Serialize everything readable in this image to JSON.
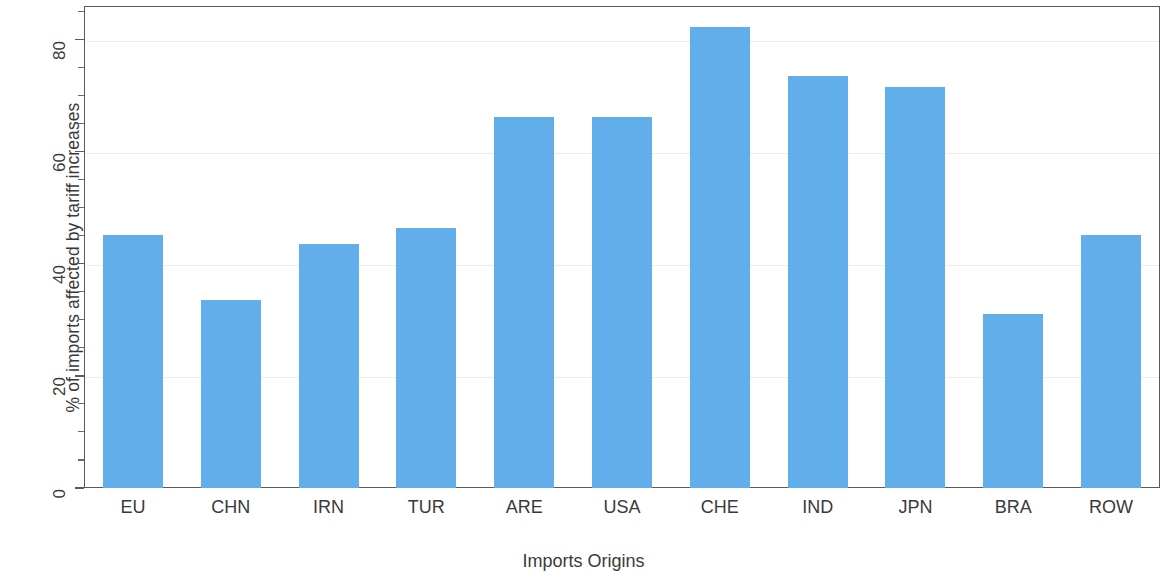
{
  "chart_data": {
    "type": "bar",
    "title": "",
    "xlabel": "Imports Origins",
    "ylabel": "% of imports affected by tariff increases",
    "categories": [
      "EU",
      "CHN",
      "IRN",
      "TUR",
      "ARE",
      "USA",
      "CHE",
      "IND",
      "JPN",
      "BRA",
      "ROW"
    ],
    "values": [
      45.2,
      33.6,
      43.6,
      46.4,
      66.2,
      66.2,
      82.2,
      73.5,
      71.5,
      31.0,
      45.1
    ],
    "ylim": [
      0,
      86
    ],
    "y_ticks": [
      0,
      20,
      40,
      60,
      80
    ],
    "y_tick_labels": [
      "0",
      "20",
      "40",
      "60",
      "80"
    ],
    "y_minor_ticks": [
      5,
      10,
      15,
      25,
      30,
      35,
      45,
      50,
      55,
      65,
      70,
      75,
      85
    ],
    "grid": "horizontal-light",
    "legend": "none",
    "bar_color": "#62AEEA",
    "axis_color": "#5a5a5a",
    "grid_color": "#ececec",
    "text_color": "#3a3a3a"
  }
}
